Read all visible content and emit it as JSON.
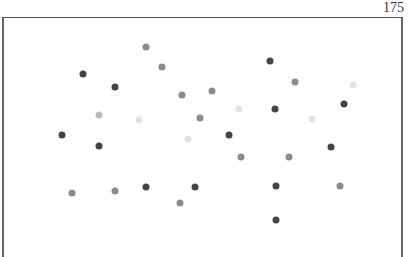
{
  "page": {
    "page_number": "175"
  },
  "figure": {
    "dot_radius": 3.5,
    "shade_colors": {
      "dark": "#444444",
      "medium": "#8c8c8c",
      "light": "#b8b8b8",
      "faint": "#e2e2e2"
    },
    "dots": [
      {
        "x": 146,
        "y": 47,
        "shade": "medium"
      },
      {
        "x": 162,
        "y": 67,
        "shade": "medium"
      },
      {
        "x": 83,
        "y": 74,
        "shade": "dark"
      },
      {
        "x": 115,
        "y": 87,
        "shade": "dark"
      },
      {
        "x": 270,
        "y": 61,
        "shade": "dark"
      },
      {
        "x": 295,
        "y": 82,
        "shade": "medium"
      },
      {
        "x": 182,
        "y": 95,
        "shade": "medium"
      },
      {
        "x": 212,
        "y": 91,
        "shade": "medium"
      },
      {
        "x": 239,
        "y": 109,
        "shade": "faint"
      },
      {
        "x": 275,
        "y": 109,
        "shade": "dark"
      },
      {
        "x": 344,
        "y": 104,
        "shade": "dark"
      },
      {
        "x": 353,
        "y": 85,
        "shade": "faint"
      },
      {
        "x": 200,
        "y": 118,
        "shade": "medium"
      },
      {
        "x": 99,
        "y": 115,
        "shade": "light"
      },
      {
        "x": 139,
        "y": 120,
        "shade": "faint"
      },
      {
        "x": 62,
        "y": 135,
        "shade": "dark"
      },
      {
        "x": 99,
        "y": 146,
        "shade": "dark"
      },
      {
        "x": 188,
        "y": 139,
        "shade": "faint"
      },
      {
        "x": 229,
        "y": 135,
        "shade": "dark"
      },
      {
        "x": 241,
        "y": 157,
        "shade": "medium"
      },
      {
        "x": 289,
        "y": 157,
        "shade": "medium"
      },
      {
        "x": 331,
        "y": 147,
        "shade": "dark"
      },
      {
        "x": 312,
        "y": 119,
        "shade": "faint"
      },
      {
        "x": 72,
        "y": 193,
        "shade": "medium"
      },
      {
        "x": 115,
        "y": 191,
        "shade": "medium"
      },
      {
        "x": 146,
        "y": 187,
        "shade": "dark"
      },
      {
        "x": 195,
        "y": 187,
        "shade": "dark"
      },
      {
        "x": 180,
        "y": 203,
        "shade": "medium"
      },
      {
        "x": 276,
        "y": 186,
        "shade": "dark"
      },
      {
        "x": 340,
        "y": 186,
        "shade": "medium"
      },
      {
        "x": 276,
        "y": 220,
        "shade": "dark"
      }
    ]
  }
}
